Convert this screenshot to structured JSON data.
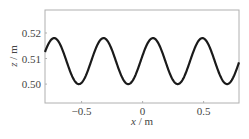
{
  "chart_data": {
    "type": "line",
    "title": "",
    "xlabel": "x / m",
    "ylabel": "z / m",
    "xlim": [
      -0.8,
      0.79
    ],
    "ylim": [
      0.4926,
      0.529
    ],
    "xticks": [
      -0.5,
      0,
      0.5
    ],
    "xtick_labels": [
      "−0.5",
      "0",
      "0.5"
    ],
    "yticks": [
      0.5,
      0.51,
      0.52
    ],
    "ytick_labels": [
      "0.50",
      "0.51",
      "0.52"
    ],
    "grid": false,
    "legend": null,
    "series": [
      {
        "name": "surface profile",
        "color": "#1a1a1a",
        "description": "sinusoid, mean 0.509 m, amplitude 0.009 m, wavelength ~0.405 m",
        "x": [
          -0.8,
          -0.76,
          -0.72,
          -0.68,
          -0.64,
          -0.6,
          -0.56,
          -0.52,
          -0.48,
          -0.44,
          -0.4,
          -0.36,
          -0.32,
          -0.28,
          -0.24,
          -0.2,
          -0.16,
          -0.12,
          -0.08,
          -0.04,
          0.0,
          0.04,
          0.08,
          0.12,
          0.16,
          0.2,
          0.24,
          0.28,
          0.32,
          0.36,
          0.4,
          0.44,
          0.48,
          0.52,
          0.56,
          0.6,
          0.64,
          0.68,
          0.72,
          0.76,
          0.79
        ],
        "y": [
          0.504,
          0.512,
          0.518,
          0.5165,
          0.511,
          0.5045,
          0.5003,
          0.501,
          0.506,
          0.5125,
          0.5172,
          0.518,
          0.5145,
          0.5085,
          0.503,
          0.5001,
          0.5015,
          0.5065,
          0.513,
          0.5172,
          0.5178,
          0.518,
          0.5178,
          0.515,
          0.5098,
          0.5045,
          0.5008,
          0.5,
          0.5025,
          0.508,
          0.514,
          0.5176,
          0.518,
          0.515,
          0.509,
          0.5035,
          0.5003,
          0.501,
          0.5055,
          0.5125,
          0.5175
        ]
      }
    ],
    "peaks_x": [
      -0.725,
      -0.377,
      0.082,
      0.49
    ],
    "troughs_x": [
      -0.565,
      -0.165,
      0.3,
      0.69
    ],
    "peak_z": 0.518,
    "trough_z": 0.5
  }
}
